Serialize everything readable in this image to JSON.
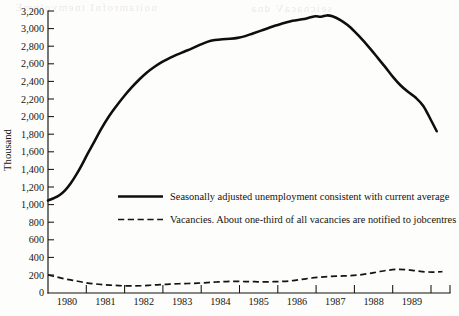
{
  "chart_data": {
    "type": "line",
    "title": "",
    "xlabel": "",
    "ylabel": "Thousand",
    "xlim": [
      1979.0,
      1989.6
    ],
    "ylim": [
      0,
      3200
    ],
    "grid": false,
    "legend_position": "inside-center-left",
    "y_ticks": [
      0,
      200,
      400,
      600,
      800,
      1000,
      1200,
      1400,
      1600,
      1800,
      2000,
      2200,
      2400,
      2600,
      2800,
      3000,
      3200
    ],
    "y_tick_labels": [
      "0",
      "200",
      "400",
      "600",
      "800",
      "1,000",
      "1,200",
      "1,400",
      "1,600",
      "1,800",
      "2,000",
      "2,200",
      "2,400",
      "2,600",
      "2,800",
      "3,000",
      "3,200"
    ],
    "x_ticks": [
      1979.0,
      1980.0,
      1981.0,
      1982.0,
      1983.0,
      1984.0,
      1985.0,
      1986.0,
      1987.0,
      1988.0,
      1989.0,
      1989.6
    ],
    "x_tick_labels": [
      "1980",
      "1981",
      "1982",
      "1983",
      "1984",
      "1985",
      "1986",
      "1987",
      "1988",
      "1989"
    ],
    "series": [
      {
        "name": "Seasonally adjusted unemployment consistent with current average",
        "style": "solid",
        "color": "#100e0b",
        "x": [
          1979.0,
          1979.15,
          1979.3,
          1979.45,
          1979.6,
          1979.75,
          1979.9,
          1980.05,
          1980.2,
          1980.4,
          1980.6,
          1980.8,
          1981.0,
          1981.2,
          1981.4,
          1981.6,
          1981.8,
          1982.0,
          1982.2,
          1982.4,
          1982.6,
          1982.8,
          1983.0,
          1983.2,
          1983.4,
          1983.6,
          1983.8,
          1984.0,
          1984.2,
          1984.4,
          1984.6,
          1984.8,
          1985.0,
          1985.2,
          1985.45,
          1985.7,
          1985.9,
          1986.05,
          1986.2,
          1986.35,
          1986.5,
          1986.7,
          1986.9,
          1987.1,
          1987.3,
          1987.5,
          1987.7,
          1987.9,
          1988.1,
          1988.3,
          1988.5,
          1988.7,
          1988.9,
          1989.1,
          1989.25
        ],
        "y": [
          1050,
          1075,
          1110,
          1165,
          1245,
          1345,
          1460,
          1585,
          1700,
          1860,
          2000,
          2120,
          2230,
          2330,
          2420,
          2500,
          2565,
          2620,
          2665,
          2705,
          2740,
          2775,
          2815,
          2850,
          2870,
          2880,
          2885,
          2895,
          2915,
          2945,
          2975,
          3005,
          3035,
          3060,
          3090,
          3105,
          3125,
          3140,
          3135,
          3150,
          3140,
          3100,
          3040,
          2960,
          2870,
          2770,
          2665,
          2560,
          2450,
          2355,
          2280,
          2215,
          2120,
          1960,
          1835
        ]
      },
      {
        "name": "Vacancies. About one-third of all vacancies are notified to jobcentres",
        "style": "dashed",
        "color": "#15130f",
        "x": [
          1979.0,
          1979.2,
          1979.45,
          1979.7,
          1979.95,
          1980.2,
          1980.45,
          1980.7,
          1980.95,
          1981.2,
          1981.45,
          1981.7,
          1981.95,
          1982.2,
          1982.45,
          1982.7,
          1982.95,
          1983.2,
          1983.45,
          1983.7,
          1983.95,
          1984.2,
          1984.45,
          1984.7,
          1984.95,
          1985.2,
          1985.45,
          1985.7,
          1985.95,
          1986.2,
          1986.45,
          1986.7,
          1986.95,
          1987.2,
          1987.45,
          1987.7,
          1987.95,
          1988.2,
          1988.45,
          1988.7,
          1988.95,
          1989.2,
          1989.4
        ],
        "y": [
          205,
          185,
          160,
          140,
          120,
          105,
          95,
          88,
          82,
          80,
          82,
          88,
          95,
          100,
          105,
          108,
          112,
          118,
          125,
          130,
          132,
          130,
          128,
          126,
          128,
          132,
          140,
          155,
          170,
          180,
          188,
          192,
          196,
          205,
          220,
          240,
          258,
          268,
          265,
          252,
          240,
          238,
          242
        ]
      }
    ]
  },
  "legend": {
    "entries": [
      {
        "label": "Seasonally adjusted unemployment consistent with current average",
        "style": "solid"
      },
      {
        "label": "Vacancies. About one-third of all vacancies are notified to jobcentres",
        "style": "dashed"
      }
    ]
  },
  "axis": {
    "y_title": "Thousand"
  }
}
